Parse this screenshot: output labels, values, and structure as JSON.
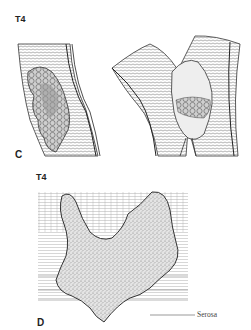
{
  "figure": {
    "panels": [
      {
        "id": "C",
        "stage_label": "T4",
        "panel_letter": "C",
        "description": "Two views of bowel wall with exophytic tumor mass penetrating through wall"
      },
      {
        "id": "D",
        "stage_label": "T4",
        "panel_letter": "D",
        "description": "Cross-section of bowel wall with V-shaped stippled tumor extending through serosa",
        "annotations": [
          {
            "label": "Serosa"
          }
        ]
      }
    ],
    "colors": {
      "background": "#ffffff",
      "ink": "#2a2a2a",
      "tumor_fill": "#d9d9d9"
    }
  }
}
